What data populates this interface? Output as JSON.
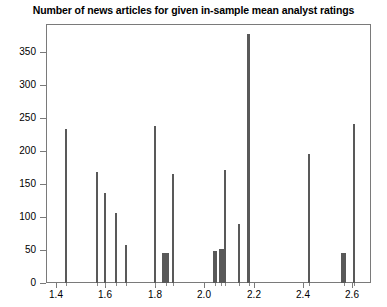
{
  "chart_data": {
    "type": "bar",
    "title": "Number of news articles for given in-sample mean analyst ratings",
    "xlabel": "",
    "ylabel": "",
    "xlim": [
      1.36,
      2.675
    ],
    "ylim": [
      0,
      393
    ],
    "grid": false,
    "legend": null,
    "bar_color": "#595959",
    "x": [
      1.44,
      1.565,
      1.6,
      1.645,
      1.685,
      1.8,
      1.845,
      1.875,
      2.045,
      2.07,
      2.085,
      2.14,
      2.18,
      2.425,
      2.565,
      2.605
    ],
    "values": [
      233,
      168,
      136,
      106,
      57,
      238,
      45,
      166,
      49,
      51,
      172,
      89,
      378,
      196,
      46,
      241
    ],
    "bar_widths": [
      2,
      2,
      2,
      2,
      2,
      2,
      7,
      2,
      4,
      5,
      2,
      2,
      3,
      2,
      5,
      2
    ],
    "xticks": [
      1.4,
      1.6,
      1.8,
      2.0,
      2.2,
      2.4,
      2.6
    ],
    "xticklabels": [
      "1.4",
      "1.6",
      "1.8",
      "2.0",
      "2.2",
      "2.4",
      "2.6"
    ],
    "yticks": [
      0,
      50,
      100,
      150,
      200,
      250,
      300,
      350
    ],
    "yticklabels": [
      "0",
      "50",
      "100",
      "150",
      "200",
      "250",
      "300",
      "350"
    ]
  }
}
